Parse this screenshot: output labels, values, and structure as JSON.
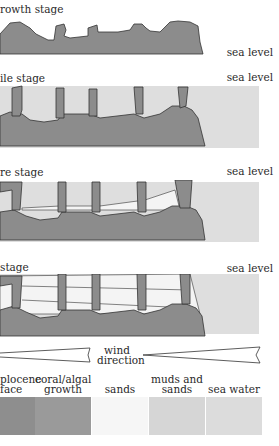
{
  "stages": [
    {
      "label": "rowth stage",
      "sea_level": "sea level"
    },
    {
      "label": "ile stage",
      "sea_level": "sea level"
    },
    {
      "label": "re stage",
      "sea_level": "sea level"
    },
    {
      "label": "stage",
      "sea_level": "sea level"
    }
  ],
  "wind": {
    "line1": "wind",
    "line2": "direction"
  },
  "legend": [
    {
      "line1": "plocene",
      "line2": "face",
      "color": "#8e8e8e"
    },
    {
      "line1": "coral/algal",
      "line2": "growth",
      "color": "#9a9a9a"
    },
    {
      "line1": "",
      "line2": "sands",
      "color": "#f6f6f6"
    },
    {
      "line1": "muds and",
      "line2": "sands",
      "color": "#d6d6d6"
    },
    {
      "line1": "",
      "line2": "sea water",
      "color": "#dcdcdc"
    }
  ],
  "colors": {
    "rock": "#8c8c8c",
    "coral": "#9c9c9c",
    "sea": "#dedede",
    "mud": "#d8d8d8",
    "sand": "#f4f4f4",
    "outline": "#333333"
  }
}
